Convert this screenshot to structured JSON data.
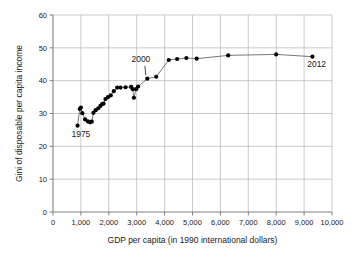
{
  "chart_data": {
    "type": "scatter",
    "title": "",
    "xlabel": "GDP per capita (in 1990 international dollars)",
    "ylabel": "Gini of disposable per capita income",
    "xlim": [
      0,
      10000
    ],
    "ylim": [
      0,
      60
    ],
    "xticks": [
      0,
      1000,
      2000,
      3000,
      4000,
      5000,
      6000,
      7000,
      8000,
      9000,
      10000
    ],
    "xtick_labels": [
      "0",
      "1,000",
      "2,000",
      "3,000",
      "4,000",
      "5,000",
      "6,000",
      "7,000",
      "8,000",
      "9,000",
      "10,000"
    ],
    "yticks": [
      0,
      10,
      20,
      30,
      40,
      50,
      60
    ],
    "ytick_labels": [
      "0",
      "10",
      "20",
      "30",
      "40",
      "50",
      "60"
    ],
    "grid": true,
    "legend": "none",
    "connected": true,
    "marker_color": "#000000",
    "line_color": "#555555",
    "grid_color": "#b4b4b4",
    "axis_color": "#808080",
    "points": [
      {
        "x": 880,
        "y": 26.3
      },
      {
        "x": 960,
        "y": 31.4
      },
      {
        "x": 1000,
        "y": 31.8
      },
      {
        "x": 1050,
        "y": 30.1
      },
      {
        "x": 1150,
        "y": 28.2
      },
      {
        "x": 1250,
        "y": 27.6
      },
      {
        "x": 1330,
        "y": 27.3
      },
      {
        "x": 1390,
        "y": 27.5
      },
      {
        "x": 1450,
        "y": 30.2
      },
      {
        "x": 1530,
        "y": 31.0
      },
      {
        "x": 1620,
        "y": 31.6
      },
      {
        "x": 1700,
        "y": 32.3
      },
      {
        "x": 1760,
        "y": 32.9
      },
      {
        "x": 1810,
        "y": 33.0
      },
      {
        "x": 1880,
        "y": 34.4
      },
      {
        "x": 1970,
        "y": 35.0
      },
      {
        "x": 2070,
        "y": 35.5
      },
      {
        "x": 2180,
        "y": 36.8
      },
      {
        "x": 2300,
        "y": 37.9
      },
      {
        "x": 2420,
        "y": 37.9
      },
      {
        "x": 2600,
        "y": 38.0
      },
      {
        "x": 2800,
        "y": 38.1
      },
      {
        "x": 2860,
        "y": 37.4
      },
      {
        "x": 2900,
        "y": 34.8
      },
      {
        "x": 2980,
        "y": 37.4
      },
      {
        "x": 3050,
        "y": 38.2
      },
      {
        "x": 3380,
        "y": 40.6
      },
      {
        "x": 3700,
        "y": 41.2
      },
      {
        "x": 4150,
        "y": 46.3
      },
      {
        "x": 4450,
        "y": 46.6
      },
      {
        "x": 4780,
        "y": 46.9
      },
      {
        "x": 5150,
        "y": 46.7
      },
      {
        "x": 6280,
        "y": 47.7
      },
      {
        "x": 8000,
        "y": 48.0
      },
      {
        "x": 9300,
        "y": 47.3
      }
    ],
    "annotations": [
      {
        "label": "1975",
        "x": 880,
        "y": 26.3,
        "text_x": 1000,
        "text_y": 22.8,
        "leader": false
      },
      {
        "label": "2000",
        "x": 3380,
        "y": 40.6,
        "text_x": 3150,
        "text_y": 45.6,
        "leader": true
      },
      {
        "label": "2012",
        "x": 9300,
        "y": 47.3,
        "text_x": 9450,
        "text_y": 44.3,
        "leader": false
      }
    ]
  }
}
